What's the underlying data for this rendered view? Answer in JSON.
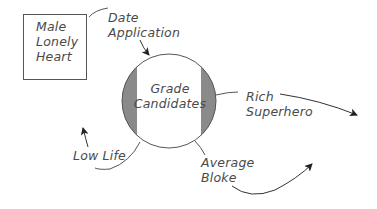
{
  "diagram": {
    "nodes": {
      "male_lonely_heart": {
        "lines": [
          "Male",
          "Lonely",
          "Heart"
        ]
      },
      "date_application": {
        "lines": [
          "Date",
          "Application"
        ]
      },
      "grade_candidates": {
        "lines": [
          "Grade",
          "Candidates"
        ]
      },
      "rich_superhero": {
        "lines": [
          "Rich",
          "Superhero"
        ]
      },
      "low_life": {
        "lines": [
          "Low Life"
        ]
      },
      "average_bloke": {
        "lines": [
          "Average",
          "Bloke"
        ]
      }
    },
    "colors": {
      "stroke": "#555555",
      "band_fill": "#8a8a8a",
      "text": "#4a4a4a"
    }
  }
}
